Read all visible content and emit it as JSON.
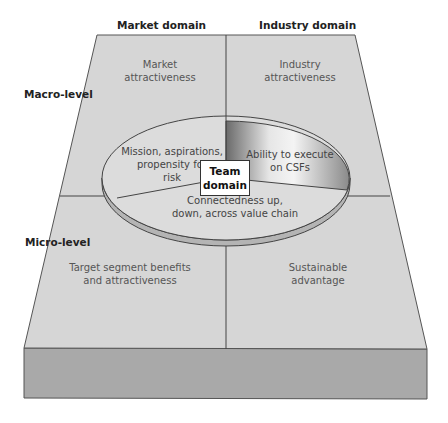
{
  "diagram": {
    "column_headers": {
      "market": "Market domain",
      "industry": "Industry domain"
    },
    "row_labels": {
      "macro": "Macro-level",
      "micro": "Micro-level"
    },
    "quadrants": {
      "top_left": [
        "Market",
        "attractiveness"
      ],
      "top_right": [
        "Industry",
        "attractiveness"
      ],
      "bottom_left": [
        "Target segment benefits",
        "and attractiveness"
      ],
      "bottom_right": [
        "Sustainable",
        "advantage"
      ]
    },
    "center": {
      "title": [
        "Team",
        "domain"
      ],
      "segments": {
        "left": [
          "Mission, aspirations,",
          "propensity for",
          "risk"
        ],
        "right": [
          "Ability to execute",
          "on CSFs"
        ],
        "bottom": [
          "Connectedness up,",
          "down, across value chain"
        ]
      }
    },
    "colors": {
      "surface": "#d6d6d6",
      "front_face": "#a9a9a9",
      "ellipse": "#dcdcdc",
      "ellipse_rim": "#b4b4b4",
      "outline": "#444444"
    }
  }
}
